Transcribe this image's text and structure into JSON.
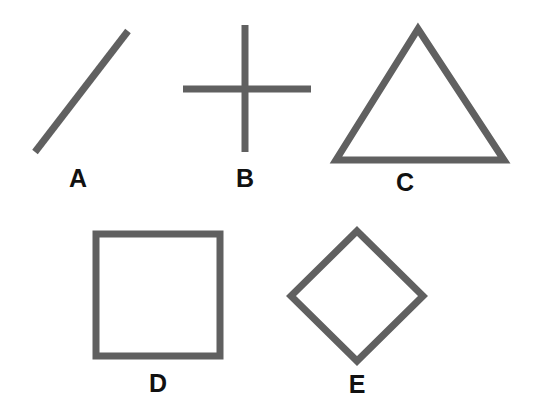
{
  "figure": {
    "width": 534,
    "height": 418,
    "background_color": "#ffffff",
    "stroke_color": "#606060",
    "label_color": "#111111",
    "stroke_width": 6,
    "label_font_size": 25
  },
  "shapes": [
    {
      "id": "A",
      "label": "A",
      "name": "line-segment",
      "kind": "line",
      "points": "35,152 128,31",
      "stroke_width": 7,
      "label_x": 78,
      "label_y": 178
    },
    {
      "id": "B",
      "label": "B",
      "name": "cross",
      "kind": "cross",
      "vertical": "245,25 245,152",
      "horizontal": "183,89 311,89",
      "stroke_width": 7,
      "label_x": 245,
      "label_y": 178
    },
    {
      "id": "C",
      "label": "C",
      "name": "triangle",
      "kind": "polygon",
      "points": "418,29 504,160 336,160",
      "stroke_width": 7,
      "label_x": 405,
      "label_y": 182
    },
    {
      "id": "D",
      "label": "D",
      "name": "square",
      "kind": "polygon",
      "points": "96,234 220,234 220,356 96,356",
      "stroke_width": 7,
      "label_x": 158,
      "label_y": 383
    },
    {
      "id": "E",
      "label": "E",
      "name": "diamond",
      "kind": "polygon",
      "points": "357,231 423,296 357,361 291,296",
      "stroke_width": 7,
      "label_x": 357,
      "label_y": 384
    }
  ]
}
